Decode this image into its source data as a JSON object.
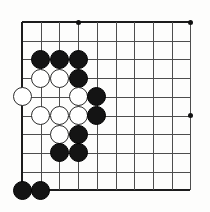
{
  "diagram": {
    "kind": "go-board-position",
    "board": {
      "columns": 10,
      "rows": 10,
      "origin_x": 22,
      "origin_y": 22,
      "spacing": 18.7,
      "line_color": "#4d4d4d",
      "edge_color": "#1c1c1c",
      "background_color": "#fdfdfc"
    },
    "star_points": [
      {
        "col": 4,
        "row": 1
      },
      {
        "col": 10,
        "row": 1
      },
      {
        "col": 10,
        "row": 6
      }
    ],
    "stones": [
      {
        "color": "black",
        "col": 2,
        "row": 3
      },
      {
        "color": "black",
        "col": 3,
        "row": 3
      },
      {
        "color": "black",
        "col": 4,
        "row": 3
      },
      {
        "color": "white",
        "col": 2,
        "row": 4
      },
      {
        "color": "white",
        "col": 3,
        "row": 4
      },
      {
        "color": "black",
        "col": 4,
        "row": 4
      },
      {
        "color": "white",
        "col": 1,
        "row": 5
      },
      {
        "color": "white",
        "col": 4,
        "row": 5
      },
      {
        "color": "black",
        "col": 5,
        "row": 5
      },
      {
        "color": "white",
        "col": 2,
        "row": 6
      },
      {
        "color": "white",
        "col": 3,
        "row": 6
      },
      {
        "color": "white",
        "col": 4,
        "row": 6
      },
      {
        "color": "black",
        "col": 5,
        "row": 6
      },
      {
        "color": "white",
        "col": 3,
        "row": 7
      },
      {
        "color": "black",
        "col": 4,
        "row": 7
      },
      {
        "color": "black",
        "col": 3,
        "row": 8
      },
      {
        "color": "black",
        "col": 4,
        "row": 8
      },
      {
        "color": "black",
        "col": 1,
        "row": 10
      },
      {
        "color": "black",
        "col": 2,
        "row": 10
      }
    ],
    "stone_colors": {
      "black_fill": "#141414",
      "black_stroke": "#000000",
      "white_fill": "#ffffff",
      "white_stroke": "#2b2b2b"
    },
    "counts": {
      "black_stones": "11",
      "white_stones": "8"
    }
  }
}
